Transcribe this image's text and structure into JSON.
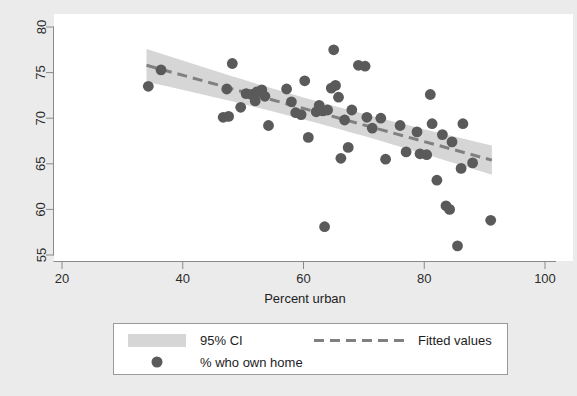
{
  "chart_data": {
    "type": "scatter",
    "title": "",
    "xlabel": "Percent urban",
    "ylabel": "",
    "xlim": [
      15.5,
      101.5
    ],
    "ylim": [
      53.6,
      81.2
    ],
    "xticks": [
      20,
      40,
      60,
      80,
      100
    ],
    "yticks": [
      55,
      60,
      65,
      70,
      75,
      80
    ],
    "xtick_labels": [
      "20",
      "40",
      "60",
      "80",
      "100"
    ],
    "ytick_labels": [
      "55",
      "60",
      "65",
      "70",
      "75",
      "80"
    ],
    "grid": false,
    "legend_position": "below-plot",
    "series": [
      {
        "name": "% who own home",
        "type": "scatter",
        "marker": "circle",
        "color": "#5a5a5a",
        "points": [
          [
            34.3,
            73.5
          ],
          [
            36.4,
            75.3
          ],
          [
            46.7,
            70.1
          ],
          [
            47.6,
            70.2
          ],
          [
            47.3,
            73.2
          ],
          [
            48.2,
            76.0
          ],
          [
            49.6,
            71.2
          ],
          [
            50.5,
            72.7
          ],
          [
            51.4,
            72.6
          ],
          [
            52.3,
            72.9
          ],
          [
            52.0,
            71.9
          ],
          [
            53.1,
            73.1
          ],
          [
            53.6,
            72.4
          ],
          [
            54.2,
            69.2
          ],
          [
            57.2,
            73.2
          ],
          [
            58.0,
            71.8
          ],
          [
            58.7,
            70.6
          ],
          [
            59.6,
            70.4
          ],
          [
            60.2,
            74.1
          ],
          [
            60.8,
            67.9
          ],
          [
            62.1,
            70.7
          ],
          [
            62.6,
            71.4
          ],
          [
            63.2,
            70.8
          ],
          [
            63.5,
            58.1
          ],
          [
            64.0,
            70.9
          ],
          [
            64.6,
            73.3
          ],
          [
            65.0,
            77.5
          ],
          [
            65.3,
            73.6
          ],
          [
            65.8,
            72.3
          ],
          [
            66.2,
            65.6
          ],
          [
            66.8,
            69.8
          ],
          [
            67.4,
            66.8
          ],
          [
            68.0,
            70.9
          ],
          [
            69.1,
            75.8
          ],
          [
            70.2,
            75.7
          ],
          [
            70.5,
            70.1
          ],
          [
            71.4,
            68.9
          ],
          [
            72.8,
            70.0
          ],
          [
            73.6,
            65.5
          ],
          [
            76.0,
            69.2
          ],
          [
            77.0,
            66.3
          ],
          [
            78.8,
            68.5
          ],
          [
            79.3,
            66.1
          ],
          [
            80.4,
            66.0
          ],
          [
            81.0,
            72.6
          ],
          [
            81.3,
            69.4
          ],
          [
            82.1,
            63.2
          ],
          [
            83.0,
            68.2
          ],
          [
            83.6,
            60.4
          ],
          [
            84.2,
            60.0
          ],
          [
            84.6,
            67.4
          ],
          [
            85.5,
            56.0
          ],
          [
            86.1,
            64.5
          ],
          [
            86.4,
            69.4
          ],
          [
            88.0,
            65.1
          ],
          [
            91.0,
            58.8
          ]
        ]
      },
      {
        "name": "Fitted values",
        "type": "line",
        "style": "dashed",
        "color": "#808080",
        "x_range": [
          34.0,
          91.2
        ],
        "y_range": [
          75.8,
          65.4
        ]
      },
      {
        "name": "95% CI",
        "type": "band",
        "color": "#d6d6d6",
        "x_range": [
          34.0,
          91.2
        ],
        "upper": [
          77.6,
          67.0
        ],
        "lower": [
          74.0,
          63.8
        ]
      }
    ],
    "annotations": []
  },
  "legend": {
    "items": [
      {
        "label": "95% CI",
        "marker": "band-swatch"
      },
      {
        "label": "Fitted values",
        "marker": "dashed-line"
      },
      {
        "label": "% who own home",
        "marker": "circle-dot"
      }
    ]
  },
  "colors": {
    "figure_background": "#ebebeb",
    "plot_background": "#ffffff",
    "marker": "#5a5a5a",
    "fit_line": "#808080",
    "ci_band": "#d6d6d6",
    "axis": "#8a8a8a",
    "legend_border": "#9a9a9a",
    "text": "#1d1d1d"
  }
}
